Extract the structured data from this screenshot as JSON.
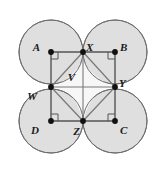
{
  "figure": {
    "canvas": {
      "width": 159,
      "height": 179,
      "background": "#ffffff"
    },
    "colors": {
      "circle_fill": "#dcdcdc",
      "circle_stroke": "#6e6e6e",
      "square_stroke": "#555555",
      "inner_stroke": "#7a7a7a",
      "inner_fill": "#f7f7f7",
      "point_fill": "#111111",
      "label_color": "#1a1a1a",
      "right_angle_stroke": "#555555"
    },
    "circles": [
      {
        "name": "circle-a",
        "cx": 51,
        "cy": 52,
        "r": 32
      },
      {
        "name": "circle-b",
        "cx": 115,
        "cy": 52,
        "r": 32
      },
      {
        "name": "circle-d",
        "cx": 51,
        "cy": 121,
        "r": 32
      },
      {
        "name": "circle-c",
        "cx": 115,
        "cy": 121,
        "r": 32
      }
    ],
    "points": [
      {
        "id": "A",
        "label": "A",
        "x": 51,
        "y": 52,
        "label_dx": -11,
        "label_dy": -4,
        "dot": true
      },
      {
        "id": "B",
        "label": "B",
        "x": 115,
        "y": 52,
        "label_dx": 5,
        "label_dy": -4,
        "dot": true
      },
      {
        "id": "C",
        "label": "C",
        "x": 115,
        "y": 121,
        "label_dx": 5,
        "label_dy": 10,
        "dot": true
      },
      {
        "id": "D",
        "label": "D",
        "x": 51,
        "y": 121,
        "label_dx": -12,
        "label_dy": 10,
        "dot": true
      },
      {
        "id": "X",
        "label": "X",
        "x": 83,
        "y": 52,
        "label_dx": 3,
        "label_dy": -4,
        "dot": true
      },
      {
        "id": "Y",
        "label": "Y",
        "x": 115,
        "y": 87,
        "label_dx": 4,
        "label_dy": -3,
        "dot": true
      },
      {
        "id": "Z",
        "label": "Z",
        "x": 83,
        "y": 121,
        "label_dx": -3,
        "label_dy": 11,
        "dot": true
      },
      {
        "id": "W",
        "label": "W",
        "x": 51,
        "y": 87,
        "label_dx": -14,
        "label_dy": 10,
        "dot": true
      },
      {
        "id": "V",
        "label": "V",
        "x": 78,
        "y": 79,
        "label_dx": -3,
        "label_dy": -1,
        "dot": false
      }
    ],
    "square": {
      "name": "square-abcd",
      "vertices": [
        "A",
        "B",
        "C",
        "D"
      ],
      "path": "M 51 52 L 115 52 L 115 121 L 51 121 Z"
    },
    "inner_quadrilateral": {
      "name": "quadrilateral-wxyz",
      "vertices": [
        "W",
        "X",
        "Y",
        "Z"
      ],
      "path": "M 51 87 L 83 52 L 115 87 L 83 121 Z"
    },
    "inner_star_path": "M 83 52 Q 83 73 51 87 Q 74 87 83 121 Q 92 87 115 87 Q 83 73 83 52 Z",
    "right_angle_marks": [
      {
        "name": "right-angle-a",
        "x": 51,
        "y": 52,
        "dx": 1,
        "dy": 1,
        "size": 7
      },
      {
        "name": "right-angle-b",
        "x": 115,
        "y": 52,
        "dx": -1,
        "dy": 1,
        "size": 7
      },
      {
        "name": "right-angle-c",
        "x": 115,
        "y": 121,
        "dx": -1,
        "dy": -1,
        "size": 7
      },
      {
        "name": "right-angle-d",
        "x": 51,
        "y": 121,
        "dx": 1,
        "dy": -1,
        "size": 7
      }
    ],
    "extra_segments": [
      {
        "name": "segment-w-y",
        "x1": 51,
        "y1": 87,
        "x2": 115,
        "y2": 87
      },
      {
        "name": "segment-x-z",
        "x1": 83,
        "y1": 52,
        "x2": 83,
        "y2": 121
      }
    ]
  }
}
